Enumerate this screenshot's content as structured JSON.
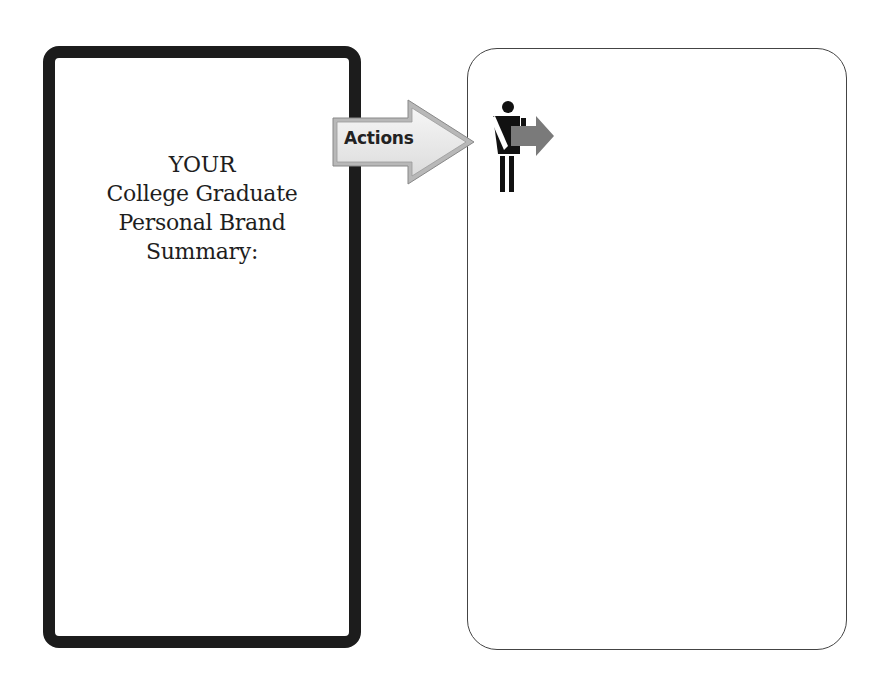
{
  "left_panel": {
    "title_lines": [
      "YOUR",
      "College Graduate",
      "Personal Brand",
      "Summary:"
    ]
  },
  "connector": {
    "label": "Actions",
    "icon": "right-arrow-icon"
  },
  "right_panel": {
    "icon": "person-holding-arrow-icon",
    "content": ""
  },
  "colors": {
    "left_border": "#1c1c1c",
    "right_border": "#444444",
    "arrow_fill": "#ececec",
    "person_arrow": "#7a7a7a"
  }
}
